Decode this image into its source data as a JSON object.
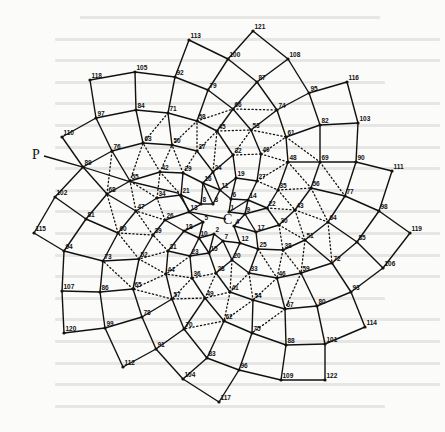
{
  "figure": {
    "center_label": "C",
    "pointer_label": "P",
    "center": [
      226,
      219
    ],
    "pointer_pos": [
      36,
      159
    ],
    "pointer_line": [
      [
        44,
        156
      ],
      [
        83,
        167
      ],
      [
        128,
        181
      ],
      [
        178,
        193
      ],
      [
        190,
        212
      ],
      [
        226,
        219
      ]
    ],
    "points": {
      "1": [
        229,
        212
      ],
      "2": [
        214,
        234
      ],
      "3": [
        213,
        204
      ],
      "4": [
        234,
        226
      ],
      "5": [
        203,
        222
      ],
      "6": [
        231,
        199
      ],
      "7": [
        223,
        241
      ],
      "8": [
        201,
        204
      ],
      "9": [
        245,
        214
      ],
      "10": [
        199,
        238
      ],
      "11": [
        220,
        190
      ],
      "12": [
        240,
        243
      ],
      "13": [
        189,
        212
      ],
      "14": [
        248,
        200
      ],
      "15": [
        209,
        253
      ],
      "16": [
        203,
        183
      ],
      "17": [
        256,
        232
      ],
      "18": [
        184,
        231
      ],
      "19": [
        236,
        178
      ],
      "20": [
        232,
        260
      ],
      "21": [
        181,
        195
      ],
      "22": [
        267,
        208
      ],
      "23": [
        190,
        256
      ],
      "24": [
        213,
        172
      ],
      "25": [
        258,
        249
      ],
      "26": [
        165,
        220
      ],
      "27": [
        257,
        181
      ],
      "28": [
        216,
        273
      ],
      "29": [
        183,
        173
      ],
      "30": [
        279,
        225
      ],
      "31": [
        168,
        251
      ],
      "32": [
        233,
        155
      ],
      "33": [
        249,
        273
      ],
      "34": [
        157,
        198
      ],
      "35": [
        278,
        190
      ],
      "36": [
        192,
        278
      ],
      "37": [
        197,
        151
      ],
      "38": [
        283,
        250
      ],
      "39": [
        153,
        235
      ],
      "40": [
        261,
        154
      ],
      "41": [
        230,
        292
      ],
      "42": [
        160,
        172
      ],
      "43": [
        295,
        210
      ],
      "44": [
        166,
        274
      ],
      "45": [
        217,
        131
      ],
      "46": [
        277,
        278
      ],
      "47": [
        136,
        211
      ],
      "48": [
        288,
        162
      ],
      "49": [
        205,
        298
      ],
      "50": [
        172,
        145
      ],
      "51": [
        305,
        240
      ],
      "52": [
        139,
        259
      ],
      "53": [
        251,
        130
      ],
      "54": [
        253,
        300
      ],
      "55": [
        130,
        181
      ],
      "56": [
        311,
        188
      ],
      "57": [
        172,
        299
      ],
      "58": [
        197,
        121
      ],
      "59": [
        301,
        273
      ],
      "60": [
        118,
        233
      ],
      "61": [
        286,
        137
      ],
      "62": [
        224,
        321
      ],
      "63": [
        143,
        143
      ],
      "64": [
        328,
        222
      ],
      "65": [
        133,
        289
      ],
      "66": [
        233,
        109
      ],
      "67": [
        285,
        309
      ],
      "68": [
        107,
        194
      ],
      "69": [
        320,
        162
      ],
      "70": [
        184,
        329
      ],
      "71": [
        168,
        113
      ],
      "72": [
        332,
        263
      ],
      "73": [
        103,
        261
      ],
      "74": [
        277,
        110
      ],
      "75": [
        252,
        333
      ],
      "76": [
        112,
        151
      ],
      "77": [
        345,
        196
      ],
      "78": [
        142,
        317
      ],
      "79": [
        208,
        90
      ],
      "80": [
        317,
        306
      ],
      "81": [
        86,
        219
      ],
      "82": [
        320,
        125
      ],
      "83": [
        207,
        358
      ],
      "84": [
        136,
        110
      ],
      "85": [
        357,
        242
      ],
      "86": [
        100,
        292
      ],
      "87": [
        257,
        82
      ],
      "88": [
        286,
        345
      ],
      "89": [
        83,
        167
      ],
      "90": [
        356,
        162
      ],
      "91": [
        156,
        349
      ],
      "92": [
        175,
        77
      ],
      "93": [
        351,
        292
      ],
      "94": [
        64,
        251
      ],
      "95": [
        309,
        93
      ],
      "96": [
        239,
        370
      ],
      "97": [
        96,
        118
      ],
      "98": [
        379,
        211
      ],
      "99": [
        105,
        328
      ],
      "100": [
        228,
        59
      ],
      "101": [
        325,
        344
      ],
      "102": [
        55,
        197
      ],
      "103": [
        358,
        123
      ],
      "104": [
        183,
        379
      ],
      "105": [
        135,
        72
      ],
      "106": [
        383,
        268
      ],
      "107": [
        62,
        291
      ],
      "108": [
        288,
        59
      ],
      "109": [
        281,
        380
      ],
      "110": [
        62,
        137
      ],
      "111": [
        392,
        171
      ],
      "112": [
        123,
        367
      ],
      "113": [
        189,
        40
      ],
      "114": [
        365,
        327
      ],
      "115": [
        34,
        233
      ],
      "116": [
        347,
        82
      ],
      "117": [
        219,
        402
      ],
      "118": [
        90,
        80
      ],
      "119": [
        410,
        233
      ],
      "120": [
        64,
        333
      ],
      "121": [
        253,
        31
      ],
      "122": [
        325,
        380
      ]
    },
    "point_count": 122
  },
  "background_text": {
    "legible": false,
    "line_count": 19
  }
}
